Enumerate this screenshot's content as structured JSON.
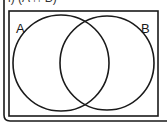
{
  "question": {
    "label": "i) (A ∩ B)"
  },
  "diagram": {
    "type": "venn",
    "universal_set": {
      "x": 9,
      "y": 11,
      "width": 149,
      "height": 105
    },
    "sets": [
      {
        "name": "A",
        "label": "A",
        "cx": 61,
        "cy": 63,
        "r": 48,
        "label_x": 16,
        "label_y": 33
      },
      {
        "name": "B",
        "label": "B",
        "cx": 107,
        "cy": 63,
        "r": 47,
        "label_x": 141,
        "label_y": 33
      }
    ],
    "stroke_color": "#1a1a1a",
    "background": "#ffffff"
  }
}
